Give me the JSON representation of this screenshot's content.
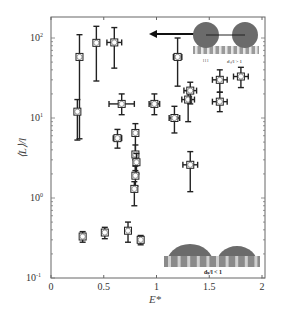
{
  "chart_data": {
    "type": "scatter",
    "title": "",
    "xlabel": "E*",
    "ylabel": "⟨L⟩/l",
    "xlim": [
      0,
      2
    ],
    "ylim": [
      0.1,
      200
    ],
    "yscale": "log",
    "xticks": [
      "0",
      "0.5",
      "1",
      "1.5",
      "2"
    ],
    "yticks": [
      "10^-1",
      "10^0",
      "10^1",
      "10^2"
    ],
    "grid": false,
    "legend": null,
    "series": [
      {
        "name": "measurements",
        "marker": "open-square-circle",
        "points": [
          {
            "x": 0.27,
            "y": 58,
            "ylo": 5.5,
            "yhi": 110,
            "xerr": 0
          },
          {
            "x": 0.25,
            "y": 12,
            "ylo": 5.3,
            "yhi": 17,
            "xerr": 0
          },
          {
            "x": 0.43,
            "y": 87,
            "ylo": 29,
            "yhi": 140,
            "xerr": 0.02
          },
          {
            "x": 0.6,
            "y": 88,
            "ylo": 42,
            "yhi": 135,
            "xerr": 0.07
          },
          {
            "x": 0.67,
            "y": 15,
            "ylo": 11,
            "yhi": 20,
            "xerr": 0.12
          },
          {
            "x": 0.63,
            "y": 5.6,
            "ylo": 4.2,
            "yhi": 7.2,
            "xerr": 0.04
          },
          {
            "x": 0.8,
            "y": 6.5,
            "ylo": 3.0,
            "yhi": 8.5,
            "xerr": 0.02
          },
          {
            "x": 0.8,
            "y": 3.5,
            "ylo": 2.2,
            "yhi": 4.6,
            "xerr": 0.02
          },
          {
            "x": 0.81,
            "y": 2.8,
            "ylo": 2.0,
            "yhi": 3.6,
            "xerr": 0.02
          },
          {
            "x": 0.8,
            "y": 1.9,
            "ylo": 1.4,
            "yhi": 2.5,
            "xerr": 0.02
          },
          {
            "x": 0.79,
            "y": 1.3,
            "ylo": 0.8,
            "yhi": 1.6,
            "xerr": 0.01
          },
          {
            "x": 0.98,
            "y": 15,
            "ylo": 11,
            "yhi": 20,
            "xerr": 0.05
          },
          {
            "x": 1.2,
            "y": 58,
            "ylo": 25,
            "yhi": 100,
            "xerr": 0.04
          },
          {
            "x": 1.17,
            "y": 10,
            "ylo": 6.5,
            "yhi": 14,
            "xerr": 0.05
          },
          {
            "x": 1.3,
            "y": 17,
            "ylo": 9,
            "yhi": 22,
            "xerr": 0.06
          },
          {
            "x": 1.32,
            "y": 22,
            "ylo": 15,
            "yhi": 28,
            "xerr": 0.06
          },
          {
            "x": 1.6,
            "y": 30,
            "ylo": 21,
            "yhi": 40,
            "xerr": 0.07
          },
          {
            "x": 1.8,
            "y": 33,
            "ylo": 24,
            "yhi": 43,
            "xerr": 0.07
          },
          {
            "x": 1.6,
            "y": 16,
            "ylo": 12,
            "yhi": 21,
            "xerr": 0.07
          },
          {
            "x": 1.32,
            "y": 2.6,
            "ylo": 1.2,
            "yhi": 3.8,
            "xerr": 0.07
          },
          {
            "x": 0.3,
            "y": 0.33,
            "ylo": 0.28,
            "yhi": 0.38,
            "xerr": 0
          },
          {
            "x": 0.51,
            "y": 0.37,
            "ylo": 0.31,
            "yhi": 0.43,
            "xerr": 0
          },
          {
            "x": 0.73,
            "y": 0.39,
            "ylo": 0.28,
            "yhi": 0.5,
            "xerr": 0.01
          },
          {
            "x": 0.85,
            "y": 0.3,
            "ylo": 0.26,
            "yhi": 0.34,
            "xerr": 0.01
          }
        ]
      }
    ],
    "annotations": [
      {
        "text": "d_s/l > 1",
        "position": "top-right inset",
        "description": "two dark spheres separated on pillars, arrow pointing left"
      },
      {
        "text": "d_s/l < 1",
        "position": "bottom-right inset",
        "description": "two dark hemispheres on pillars"
      }
    ]
  },
  "axes": {
    "xlabel": "E*",
    "ylabel": "⟨L⟩/l",
    "xticks": [
      "0",
      "0.5",
      "1",
      "1.5",
      "2"
    ],
    "yticks": [
      {
        "base": "10",
        "exp": "2"
      },
      {
        "base": "10",
        "exp": "1"
      },
      {
        "base": "10",
        "exp": "0"
      },
      {
        "base": "10",
        "exp": "-1"
      }
    ]
  },
  "insets": {
    "top_label": "dₛ/l > 1",
    "top_sub": "l l l",
    "bottom_label": "dₛ/l < 1"
  },
  "colors": {
    "axis": "#555555",
    "marker": "#222222",
    "sphere": "#6b6b6b",
    "pillar": "#a8a8a8"
  }
}
